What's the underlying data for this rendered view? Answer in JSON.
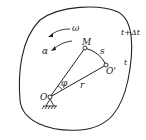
{
  "diagram": {
    "type": "rigid-body-rotation",
    "labels": {
      "omega": "ω",
      "alpha": "α",
      "point_M": "M",
      "arc_s": "s",
      "point_O_prime": "O'",
      "angle_phi": "φ",
      "radius_r": "r",
      "point_O": "O",
      "time_later": "t+Δt",
      "time_now": "t"
    },
    "colors": {
      "stroke": "#222222",
      "background": "#ffffff"
    }
  }
}
